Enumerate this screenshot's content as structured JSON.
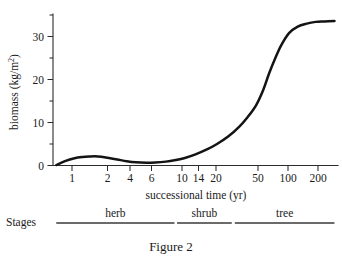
{
  "figure": {
    "caption": "Figure 2",
    "background_color": "#ffffff",
    "line_color": "#141414",
    "axis_color": "#2b2b2b"
  },
  "chart_data": {
    "type": "line",
    "title": "",
    "xlabel": "successional time (yr)",
    "ylabel": "biomass (kg/m²)",
    "ylabel_text": "biomass (kg/m",
    "ylabel_sup": "2",
    "ylabel_tail": ")",
    "x_scale": "log",
    "y_scale": "linear",
    "xlim": [
      0.7,
      280
    ],
    "ylim": [
      0,
      35
    ],
    "grid": false,
    "legend": "none",
    "x_ticks": [
      1,
      2,
      4,
      6,
      10,
      14,
      20,
      50,
      100,
      200
    ],
    "x_tick_labels": [
      "1",
      "2",
      "4",
      "6",
      "10",
      "14",
      "20",
      "50",
      "100",
      "200"
    ],
    "y_ticks": [
      0,
      10,
      20,
      30
    ],
    "y_tick_labels": [
      "0",
      "10",
      "20",
      "30"
    ],
    "y_minor_ticks": [
      5,
      15,
      25
    ],
    "series": [
      {
        "name": "biomass",
        "x": [
          0.75,
          0.9,
          1.1,
          1.3,
          1.5,
          1.8,
          2.2,
          2.7,
          3.3,
          4.0,
          5.0,
          6.0,
          7.5,
          9.0,
          11,
          14,
          18,
          22,
          28,
          35,
          42,
          50,
          58,
          66,
          75,
          85,
          100,
          120,
          145,
          175,
          210,
          260
        ],
        "y": [
          0.1,
          1.0,
          1.7,
          2.0,
          2.1,
          2.1,
          1.8,
          1.4,
          1.0,
          0.75,
          0.65,
          0.7,
          0.9,
          1.2,
          1.7,
          2.6,
          3.8,
          5.0,
          6.8,
          9.0,
          11.3,
          14.0,
          17.5,
          21.5,
          25.0,
          28.0,
          30.8,
          32.3,
          33.0,
          33.4,
          33.5,
          33.6
        ]
      }
    ],
    "annotations": {
      "plateau_value": 33.5,
      "first_peak_value": 2.1,
      "trough_value": 0.65
    }
  },
  "stages": {
    "label": "Stages",
    "segments": [
      {
        "name": "herb",
        "from_year": 0.75,
        "to_year": 9
      },
      {
        "name": "shrub",
        "from_year": 9.5,
        "to_year": 30
      },
      {
        "name": "tree",
        "from_year": 32,
        "to_year": 260
      }
    ]
  }
}
